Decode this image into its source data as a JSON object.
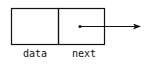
{
  "diagram": {
    "type": "linked-list-node",
    "fields": [
      {
        "label": "data"
      },
      {
        "label": "next"
      }
    ],
    "colors": {
      "stroke": "#111111",
      "background": "#ffffff"
    }
  }
}
